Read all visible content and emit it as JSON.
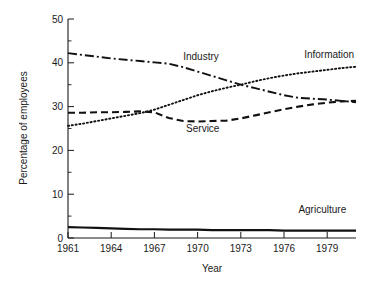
{
  "chart_data": {
    "type": "line",
    "title": "",
    "xlabel": "Year",
    "ylabel": "Percentage of employees",
    "xlim": [
      1961,
      1981
    ],
    "ylim": [
      0,
      50
    ],
    "grid": false,
    "legend_position": "inline-labels",
    "x_ticks": [
      1961,
      1964,
      1967,
      1970,
      1973,
      1976,
      1979
    ],
    "x_tick_labels": [
      "1961",
      "1964",
      "1967",
      "1970",
      "1973",
      "1976",
      "1979"
    ],
    "x_minor_ticks": [
      1962,
      1963,
      1965,
      1966,
      1968,
      1969,
      1971,
      1972,
      1974,
      1975,
      1977,
      1978,
      1980
    ],
    "y_ticks": [
      0,
      10,
      20,
      30,
      40,
      50
    ],
    "y_tick_labels": [
      "0",
      "10",
      "20",
      "30",
      "40",
      "50"
    ],
    "y_minor_ticks": [
      5,
      15,
      25,
      35,
      45
    ],
    "x": [
      1961,
      1962,
      1963,
      1964,
      1965,
      1966,
      1967,
      1968,
      1969,
      1970,
      1971,
      1972,
      1973,
      1974,
      1975,
      1976,
      1977,
      1978,
      1979,
      1980,
      1981
    ],
    "series": [
      {
        "name": "Industry",
        "label": "Industry",
        "line_style": "dash-dot",
        "color": "#111111",
        "values": [
          42.2,
          41.8,
          41.4,
          41.0,
          40.7,
          40.4,
          40.1,
          39.8,
          39.0,
          38.0,
          37.0,
          36.0,
          35.0,
          34.2,
          33.4,
          32.6,
          32.0,
          31.8,
          31.6,
          31.3,
          31.0
        ]
      },
      {
        "name": "Information",
        "label": "Information",
        "line_style": "dotted",
        "color": "#111111",
        "values": [
          25.6,
          26.1,
          26.7,
          27.3,
          27.9,
          28.5,
          29.3,
          30.4,
          31.5,
          32.6,
          33.5,
          34.3,
          35.0,
          35.8,
          36.5,
          37.1,
          37.6,
          38.0,
          38.4,
          38.8,
          39.1
        ]
      },
      {
        "name": "Service",
        "label": "Service",
        "line_style": "dashed",
        "color": "#111111",
        "values": [
          28.6,
          28.6,
          28.7,
          28.7,
          28.8,
          28.9,
          28.7,
          27.4,
          26.7,
          26.6,
          26.7,
          26.8,
          27.3,
          28.0,
          28.7,
          29.4,
          30.0,
          30.5,
          30.9,
          31.2,
          31.3
        ]
      },
      {
        "name": "Agriculture",
        "label": "Agriculture",
        "line_style": "solid",
        "color": "#111111",
        "values": [
          2.5,
          2.4,
          2.3,
          2.2,
          2.1,
          2.0,
          2.0,
          1.9,
          1.9,
          1.9,
          1.8,
          1.8,
          1.8,
          1.8,
          1.8,
          1.7,
          1.7,
          1.7,
          1.7,
          1.7,
          1.7
        ]
      }
    ],
    "annotations": [
      {
        "name": "industry-label",
        "text": "Industry",
        "x": 1969.0,
        "y": 40.6,
        "anchor": "start"
      },
      {
        "name": "information-label",
        "text": "Information",
        "x": 1977.4,
        "y": 41.2,
        "anchor": "start"
      },
      {
        "name": "service-label",
        "text": "Service",
        "x": 1969.2,
        "y": 24.2,
        "anchor": "start"
      },
      {
        "name": "agriculture-label",
        "text": "Agriculture",
        "x": 1977.0,
        "y": 5.6,
        "anchor": "start"
      }
    ]
  },
  "axes": {
    "y_title": "Percentage of employees",
    "x_title": "Year"
  }
}
